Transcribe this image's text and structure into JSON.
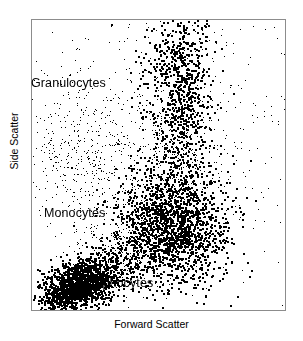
{
  "figure": {
    "kind": "flow-cytometry-scatter",
    "background_color": "#ffffff",
    "border_color": "#8c8c8c",
    "point_color": "#000000"
  },
  "axes": {
    "x_label": "Forward Scatter",
    "y_label": "Side Scatter"
  },
  "labels": {
    "granulocytes": "Granulocytes",
    "monocytes": "Monocytes",
    "lymphocytes": "Lymphocytes"
  },
  "chart_data": {
    "type": "scatter",
    "title": "",
    "xlabel": "Forward Scatter",
    "ylabel": "Side Scatter",
    "xlim": [
      0,
      100
    ],
    "ylim": [
      0,
      100
    ],
    "grid": false,
    "legend": "none",
    "axis_ticks": "none",
    "annotations": [
      {
        "text": "Granulocytes",
        "x": 22,
        "y": 78,
        "leader": "dash-right"
      },
      {
        "text": "Monocytes",
        "x": 28,
        "y": 34
      },
      {
        "text": "Lymphocytes",
        "x": 44,
        "y": 10
      }
    ],
    "populations": [
      {
        "name": "Lymphocytes",
        "n": 1500,
        "center": [
          19,
          9
        ],
        "spread": [
          8.5,
          4.2
        ],
        "rotation_deg": 22,
        "density": "very-high",
        "point_size": 1.6
      },
      {
        "name": "Monocytes",
        "n": 1700,
        "center": [
          55,
          29
        ],
        "spread": [
          11,
          10
        ],
        "rotation_deg": 0,
        "density": "high",
        "point_size": 1.5
      },
      {
        "name": "Granulocytes",
        "n": 900,
        "center": [
          58,
          78
        ],
        "spread": [
          6.5,
          19
        ],
        "rotation_deg": 0,
        "density": "medium-high",
        "point_size": 1.5
      },
      {
        "name": "Lymph-Mono bridge",
        "n": 320,
        "center": [
          38,
          20
        ],
        "spread": [
          9,
          7
        ],
        "rotation_deg": 40,
        "density": "medium",
        "point_size": 1.4
      },
      {
        "name": "Mono-Gran bridge",
        "n": 260,
        "center": [
          57,
          52
        ],
        "spread": [
          6,
          12
        ],
        "rotation_deg": 0,
        "density": "medium-low",
        "point_size": 1.4
      },
      {
        "name": "Debris diagonal",
        "n": 430,
        "center": [
          22,
          52
        ],
        "spread": [
          12,
          16
        ],
        "rotation_deg": 55,
        "density": "low",
        "point_size": 1.3
      },
      {
        "name": "Background noise",
        "n": 620,
        "center": [
          52,
          62
        ],
        "spread": [
          30,
          28
        ],
        "rotation_deg": 0,
        "density": "sparse",
        "point_size": 1.3
      }
    ]
  }
}
